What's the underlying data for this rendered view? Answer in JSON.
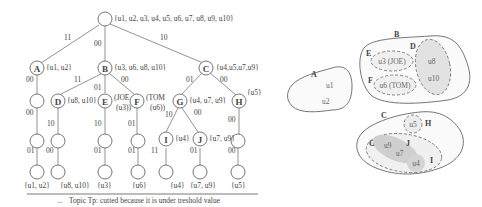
{
  "tree": {
    "root": {
      "label": "",
      "set": "{u1, u2, u3, u4, u5, u6, u7, u8, u9, u10}"
    },
    "level1": [
      {
        "id": "A",
        "edge": "11",
        "set": "{u1, u2}"
      },
      {
        "id": "B",
        "edge": "00",
        "set": "{u3, u6, u8, u10}"
      },
      {
        "id": "C",
        "edge": "10",
        "set": "{u4,u5,u7,u9}"
      }
    ],
    "level2": [
      {
        "id": "",
        "edge": "00",
        "parent": "A"
      },
      {
        "id": "D",
        "edge": "11",
        "set": "{u8, u10}",
        "parent": "B"
      },
      {
        "id": "E",
        "edge": "01",
        "set_line1": "(JOE",
        "set_line2": "(u3))",
        "parent": "B"
      },
      {
        "id": "F",
        "edge": "00",
        "set_line1": "(TOM",
        "set_line2": "(u6))",
        "parent": "B"
      },
      {
        "id": "G",
        "edge": "01",
        "set": "{u4, u7, u9}",
        "parent": "C"
      },
      {
        "id": "H",
        "edge": "00",
        "set": "{u5}",
        "parent": "C"
      }
    ],
    "level3": [
      {
        "id": "",
        "edge": "00",
        "parent": "A-child"
      },
      {
        "id": "",
        "edge": "10",
        "parent": "D"
      },
      {
        "id": "",
        "edge": "10",
        "parent": "E"
      },
      {
        "id": "",
        "edge": "01",
        "parent": "F"
      },
      {
        "id": "I",
        "edge": "10",
        "set": "{u4}",
        "parent": "G"
      },
      {
        "id": "J",
        "edge": "00",
        "set": "{u7, u9}",
        "parent": "G"
      },
      {
        "id": "",
        "edge": "00",
        "parent": "H"
      }
    ],
    "leaves": [
      {
        "edge": "01",
        "set": "{u1, u2}"
      },
      {
        "edge": "00",
        "set": "{u8, u10}"
      },
      {
        "edge": "01",
        "set": "{u3}"
      },
      {
        "edge": "01",
        "set": "{u6}"
      },
      {
        "edge": "11",
        "set": "{u4}"
      },
      {
        "edge": "01",
        "set": "{u7, u9}"
      },
      {
        "edge": "00",
        "set": "{u5}"
      }
    ],
    "footnote": "Topic Tp: cutted because it is under treshold value",
    "footnote_marker": "..."
  },
  "venn": {
    "A": {
      "label": "A",
      "members": [
        "u1",
        "u2"
      ]
    },
    "B": {
      "label": "B",
      "E": {
        "label": "E",
        "text": "u3 (JOE)"
      },
      "F": {
        "label": "F",
        "text": "u6 (TOM)"
      },
      "D": {
        "label": "D",
        "members": [
          "u8",
          "u10"
        ]
      }
    },
    "C": {
      "label": "C",
      "H": {
        "label": "H",
        "members": [
          "u5"
        ]
      },
      "G": {
        "label": "G"
      },
      "J": {
        "label": "J",
        "members": [
          "u9",
          "u7"
        ]
      },
      "I": {
        "label": "I",
        "members": [
          "u4"
        ]
      }
    }
  }
}
